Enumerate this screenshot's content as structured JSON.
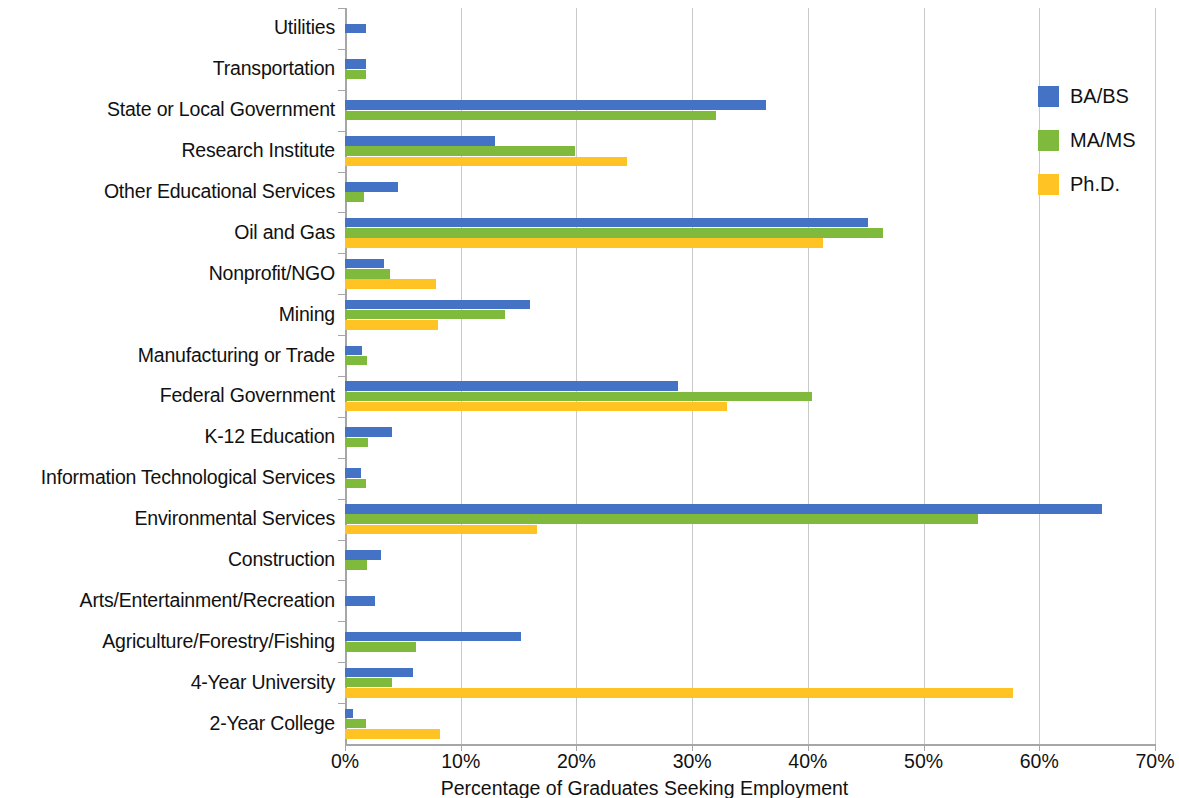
{
  "chart_data": {
    "type": "bar",
    "orientation": "horizontal",
    "title": "",
    "xlabel": "Percentage of Graduates Seeking Employment",
    "ylabel": "",
    "xlim": [
      0,
      70
    ],
    "xticks": [
      0,
      10,
      20,
      30,
      40,
      50,
      60,
      70
    ],
    "xtick_labels": [
      "0%",
      "10%",
      "20%",
      "30%",
      "40%",
      "50%",
      "60%",
      "70%"
    ],
    "grid": "vertical",
    "legend_position": "top-right",
    "categories": [
      "Utilities",
      "Transportation",
      "State or Local Government",
      "Research Institute",
      "Other Educational Services",
      "Oil and Gas",
      "Nonprofit/NGO",
      "Mining",
      "Manufacturing or Trade",
      "Federal Government",
      "K-12 Education",
      "Information Technological Services",
      "Environmental Services",
      "Construction",
      "Arts/Entertainment/Recreation",
      "Agriculture/Forestry/Fishing",
      "4-Year University",
      "2-Year College"
    ],
    "series": [
      {
        "name": "BA/BS",
        "color": "#4472c4",
        "values": [
          1.8,
          1.8,
          36.4,
          13.0,
          4.6,
          45.2,
          3.4,
          16.0,
          1.5,
          28.8,
          4.1,
          1.4,
          65.4,
          3.1,
          2.6,
          15.2,
          5.9,
          0.7
        ]
      },
      {
        "name": "MA/MS",
        "color": "#7fba3d",
        "values": [
          0,
          1.8,
          32.1,
          19.9,
          1.6,
          46.5,
          3.9,
          13.8,
          1.9,
          40.4,
          2.0,
          1.8,
          54.7,
          1.9,
          0,
          6.1,
          4.1,
          1.8
        ]
      },
      {
        "name": "Ph.D.",
        "color": "#ffc423",
        "values": [
          0,
          0,
          0,
          24.4,
          0,
          41.3,
          7.9,
          8.0,
          0,
          33.0,
          0,
          0,
          16.6,
          0,
          0,
          0,
          57.7,
          8.2
        ]
      }
    ]
  }
}
